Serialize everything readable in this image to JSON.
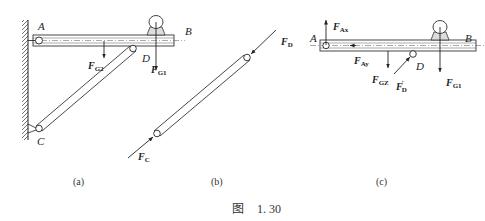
{
  "figure": {
    "caption_prefix": "图",
    "caption_number": "1. 30"
  },
  "panels": {
    "a": {
      "caption": "(a)",
      "points": {
        "A": "A",
        "B": "B",
        "C": "C",
        "D": "D"
      },
      "forces": {
        "G2": {
          "main": "F",
          "sub": "G2"
        },
        "G1": {
          "main": "F",
          "sub": "G1"
        }
      }
    },
    "b": {
      "caption": "(b)",
      "forces": {
        "D": {
          "main": "F",
          "sub": "D"
        },
        "C": {
          "main": "F",
          "sub": "C"
        }
      }
    },
    "c": {
      "caption": "(c)",
      "points": {
        "A": "A",
        "B": "B",
        "D": "D"
      },
      "forces": {
        "Ax": {
          "main": "F",
          "sub": "Ax"
        },
        "Ay": {
          "main": "F",
          "sub": "Ay"
        },
        "G2": {
          "main": "F",
          "sub": "GZ"
        },
        "Dp": {
          "main": "F",
          "sub": "D",
          "prime": "′"
        },
        "G1": {
          "main": "F",
          "sub": "G1"
        }
      }
    }
  }
}
